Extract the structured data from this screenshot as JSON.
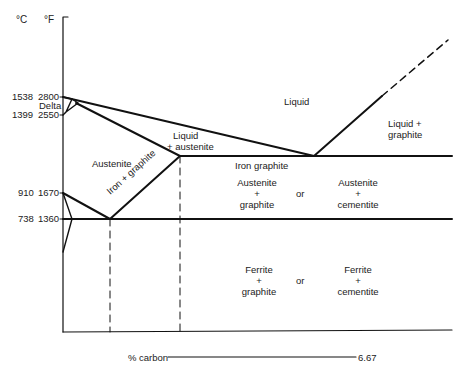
{
  "diagram": {
    "axis": {
      "y_units": {
        "celsius": "°C",
        "fahrenheit": "°F"
      },
      "y_ticks": [
        {
          "c": "1538",
          "f": "2800"
        },
        {
          "label": "Delta"
        },
        {
          "c": "1399",
          "f": "2550"
        },
        {
          "c": "910",
          "f": "1670"
        },
        {
          "c": "738",
          "f": "1360"
        }
      ],
      "x_label": "% carbon",
      "x_max": "6.67"
    },
    "regions": {
      "liquid": "Liquid",
      "liquid_graphite_1": "Liquid +",
      "liquid_graphite_2": "graphite",
      "liquid_austenite_1": "Liquid",
      "liquid_austenite_2": "+ austenite",
      "austenite": "Austenite",
      "iron_graphite_diag": "Iron + graphite",
      "iron_graphite": "Iron graphite",
      "aust_graphite_1": "Austenite",
      "aust_graphite_2": "+",
      "aust_graphite_3": "graphite",
      "or_1": "or",
      "aust_cementite_1": "Austenite",
      "aust_cementite_2": "+",
      "aust_cementite_3": "cementite",
      "ferrite_graphite_1": "Ferrite",
      "ferrite_graphite_2": "+",
      "ferrite_graphite_3": "graphite",
      "or_2": "or",
      "ferrite_cementite_1": "Ferrite",
      "ferrite_cementite_2": "+",
      "ferrite_cementite_3": "cementite"
    },
    "line_color": "#111111"
  }
}
